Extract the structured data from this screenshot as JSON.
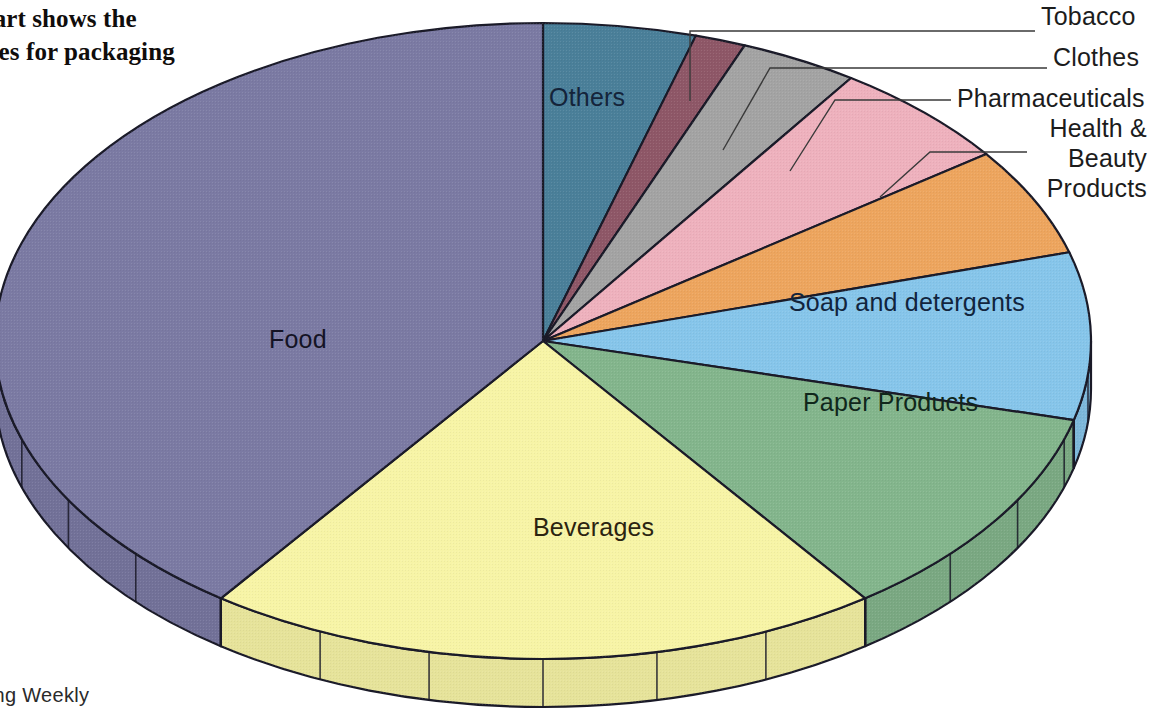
{
  "caption": {
    "text": "-chart shows the\nt uses for packaging\nK.",
    "note_clipped": true
  },
  "source": {
    "text": "aging Weekly"
  },
  "labels": {
    "tobacco": "Tobacco",
    "clothes": "Clothes",
    "pharmaceuticals": "Pharmaceuticals",
    "health_beauty": "Health &\nBeauty\nProducts",
    "others": "Others",
    "soap": "Soap and detergents",
    "paper": "Paper Products",
    "beverages": "Beverages",
    "food": "Food"
  },
  "chart_data": {
    "type": "pie",
    "title": "",
    "subtitle": "",
    "xlabel": "",
    "ylabel": "",
    "legend_position": "callout-labels",
    "grid": false,
    "three_d": true,
    "start_angle_deg": -90,
    "direction": "clockwise",
    "center_px": [
      543,
      341
    ],
    "radius_x_px": 548,
    "radius_y_px": 318,
    "depth_px": 48,
    "categories": [
      "Others",
      "Tobacco",
      "Clothes",
      "Pharmaceuticals",
      "Health & Beauty Products",
      "Soap and detergents",
      "Paper Products",
      "Beverages",
      "Food"
    ],
    "values": [
      4.5,
      1.5,
      3.5,
      5.5,
      5.5,
      8.5,
      11.0,
      20.0,
      40.0
    ],
    "units": "percent",
    "slices": [
      {
        "label": "Others",
        "value": 4.5,
        "color": "#4a7f99",
        "edge": "#23323c",
        "start_deg": -90.0,
        "end_deg": -73.8
      },
      {
        "label": "Tobacco",
        "value": 1.5,
        "color": "#8e5767",
        "edge": "#3a2630",
        "start_deg": -73.8,
        "end_deg": -68.4
      },
      {
        "label": "Clothes",
        "value": 3.5,
        "color": "#a3a3a3",
        "edge": "#3a3a3a",
        "start_deg": -68.4,
        "end_deg": -55.8
      },
      {
        "label": "Pharmaceuticals",
        "value": 5.5,
        "color": "#eeb1bd",
        "edge": "#6a4048",
        "start_deg": -55.8,
        "end_deg": -36.0
      },
      {
        "label": "Health & Beauty Products",
        "value": 5.5,
        "color": "#eda55e",
        "edge": "#6b401f",
        "start_deg": -36.0,
        "end_deg": -16.2
      },
      {
        "label": "Soap and detergents",
        "value": 8.5,
        "color": "#86c5ea",
        "edge": "#26404f",
        "start_deg": -16.2,
        "end_deg": 14.4
      },
      {
        "label": "Paper Products",
        "value": 11.0,
        "color": "#83b58c",
        "edge": "#243c29",
        "start_deg": 14.4,
        "end_deg": 54.0
      },
      {
        "label": "Beverages",
        "value": 20.0,
        "color": "#f7f4a6",
        "edge": "#50502c",
        "start_deg": 54.0,
        "end_deg": 126.0
      },
      {
        "label": "Food",
        "value": 40.0,
        "color": "#7b7aa3",
        "edge": "#2b2a3e",
        "start_deg": 126.0,
        "end_deg": 270.0
      }
    ],
    "colors": {
      "others": "#4a7f99",
      "tobacco": "#8e5767",
      "clothes": "#a3a3a3",
      "pharmaceuticals": "#eeb1bd",
      "health_beauty": "#eda55e",
      "soap": "#86c5ea",
      "paper": "#83b58c",
      "beverages": "#f7f4a6",
      "food": "#7b7aa3",
      "outline": "#1a1a28",
      "background": "#ffffff"
    }
  }
}
